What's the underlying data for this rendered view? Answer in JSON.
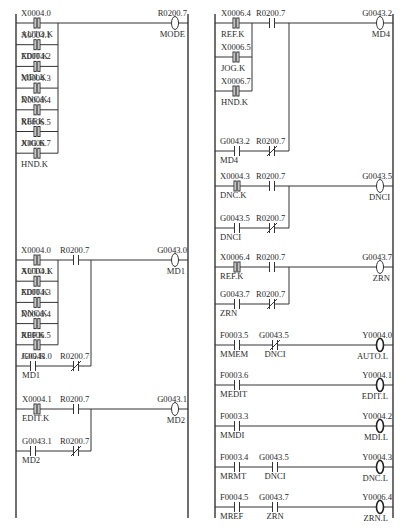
{
  "left_panel": {
    "rungs": [
      {
        "id": "rung-mode",
        "branches": [
          {
            "contact": {
              "addr": "X0004.0",
              "name": "AUTO.K",
              "type": "pulse"
            }
          },
          {
            "contact": {
              "addr": "X0004.1",
              "name": "EDIT.K",
              "type": "pulse"
            }
          },
          {
            "contact": {
              "addr": "X0004.2",
              "name": "MDI.K",
              "type": "pulse"
            }
          },
          {
            "contact": {
              "addr": "X0004.3",
              "name": "DNC.K",
              "type": "pulse"
            }
          },
          {
            "contact": {
              "addr": "X0006.4",
              "name": "REF.K",
              "type": "pulse"
            }
          },
          {
            "contact": {
              "addr": "X0006.5",
              "name": "JOG.K",
              "type": "pulse"
            }
          },
          {
            "contact": {
              "addr": "X0006.7",
              "name": "HND.K",
              "type": "pulse"
            }
          }
        ],
        "series": [],
        "coil": {
          "addr": "R0200.7",
          "name": "MODE",
          "type": "normal"
        }
      },
      {
        "id": "rung-md1",
        "branches": [
          {
            "contact": {
              "addr": "X0004.0",
              "name": "AUTO.K",
              "type": "pulse"
            }
          },
          {
            "contact": {
              "addr": "X0004.1",
              "name": "EDIT.K",
              "type": "pulse"
            }
          },
          {
            "contact": {
              "addr": "X0004.3",
              "name": "DNC.K",
              "type": "pulse"
            }
          },
          {
            "contact": {
              "addr": "X0006.4",
              "name": "REF.K",
              "type": "pulse"
            }
          },
          {
            "contact": {
              "addr": "X0006.5",
              "name": "JOG.K",
              "type": "pulse"
            }
          }
        ],
        "series": [
          {
            "addr": "R0200.7",
            "name": "",
            "type": "no"
          }
        ],
        "hold": [
          {
            "addr": "G0043.0",
            "name": "MD1",
            "type": "no"
          },
          {
            "addr": "R0200.7",
            "name": "",
            "type": "nc"
          }
        ],
        "coil": {
          "addr": "G0043.0",
          "name": "MD1",
          "type": "normal"
        }
      },
      {
        "id": "rung-md2",
        "main": [
          {
            "addr": "X0004.1",
            "name": "EDIT.K",
            "type": "pulse"
          },
          {
            "addr": "R0200.7",
            "name": "",
            "type": "no"
          }
        ],
        "hold": [
          {
            "addr": "G0043.1",
            "name": "MD2",
            "type": "no"
          },
          {
            "addr": "R0200.7",
            "name": "",
            "type": "nc"
          }
        ],
        "coil": {
          "addr": "G0043.1",
          "name": "MD2",
          "type": "normal"
        }
      }
    ]
  },
  "right_panel": {
    "rungs": [
      {
        "id": "rung-md4",
        "branches": [
          {
            "contact": {
              "addr": "X0006.4",
              "name": "REF.K",
              "type": "pulse"
            }
          },
          {
            "contact": {
              "addr": "X0006.5",
              "name": "JOG.K",
              "type": "pulse"
            }
          },
          {
            "contact": {
              "addr": "X0006.7",
              "name": "HND.K",
              "type": "pulse"
            }
          }
        ],
        "series": [
          {
            "addr": "R0200.7",
            "name": "",
            "type": "no"
          }
        ],
        "hold": [
          {
            "addr": "G0043.2",
            "name": "MD4",
            "type": "no"
          },
          {
            "addr": "R0200.7",
            "name": "",
            "type": "nc"
          }
        ],
        "coil": {
          "addr": "G0043.2",
          "name": "MD4",
          "type": "normal"
        }
      },
      {
        "id": "rung-dnci",
        "main": [
          {
            "addr": "X0004.3",
            "name": "DNC.K",
            "type": "pulse"
          },
          {
            "addr": "R0200.7",
            "name": "",
            "type": "no"
          }
        ],
        "hold": [
          {
            "addr": "G0043.5",
            "name": "DNCI",
            "type": "no"
          },
          {
            "addr": "R0200.7",
            "name": "",
            "type": "nc"
          }
        ],
        "coil": {
          "addr": "G0043.5",
          "name": "DNCI",
          "type": "normal"
        }
      },
      {
        "id": "rung-zrn",
        "main": [
          {
            "addr": "X0006.4",
            "name": "REF.K",
            "type": "pulse"
          },
          {
            "addr": "R0200.7",
            "name": "",
            "type": "no"
          }
        ],
        "hold": [
          {
            "addr": "G0043.7",
            "name": "ZRN",
            "type": "no"
          },
          {
            "addr": "R0200.7",
            "name": "",
            "type": "nc"
          }
        ],
        "coil": {
          "addr": "G0043.7",
          "name": "ZRN",
          "type": "normal"
        }
      },
      {
        "id": "rung-auto-lamp",
        "main": [
          {
            "addr": "F0003.5",
            "name": "MMEM",
            "type": "no"
          },
          {
            "addr": "G0043.5",
            "name": "DNCI",
            "type": "nc"
          }
        ],
        "coil": {
          "addr": "Y0004.0",
          "name": "AUTO.L",
          "type": "output"
        }
      },
      {
        "id": "rung-edit-lamp",
        "main": [
          {
            "addr": "F0003.6",
            "name": "MEDIT",
            "type": "no"
          }
        ],
        "coil": {
          "addr": "Y0004.1",
          "name": "EDIT.L",
          "type": "output"
        }
      },
      {
        "id": "rung-mdi-lamp",
        "main": [
          {
            "addr": "F0003.3",
            "name": "MMDI",
            "type": "no"
          }
        ],
        "coil": {
          "addr": "Y0004.2",
          "name": "MDI.L",
          "type": "output"
        }
      },
      {
        "id": "rung-dnc-lamp",
        "main": [
          {
            "addr": "F0003.4",
            "name": "MRMT",
            "type": "no"
          },
          {
            "addr": "G0043.5",
            "name": "DNCI",
            "type": "no"
          }
        ],
        "coil": {
          "addr": "Y0004.3",
          "name": "DNC.L",
          "type": "output"
        }
      },
      {
        "id": "rung-zrn-lamp",
        "main": [
          {
            "addr": "F0004.5",
            "name": "MREF",
            "type": "no"
          },
          {
            "addr": "G0043.7",
            "name": "ZRN",
            "type": "no"
          }
        ],
        "coil": {
          "addr": "Y0006.4",
          "name": "ZRN.L",
          "type": "output"
        }
      }
    ]
  }
}
